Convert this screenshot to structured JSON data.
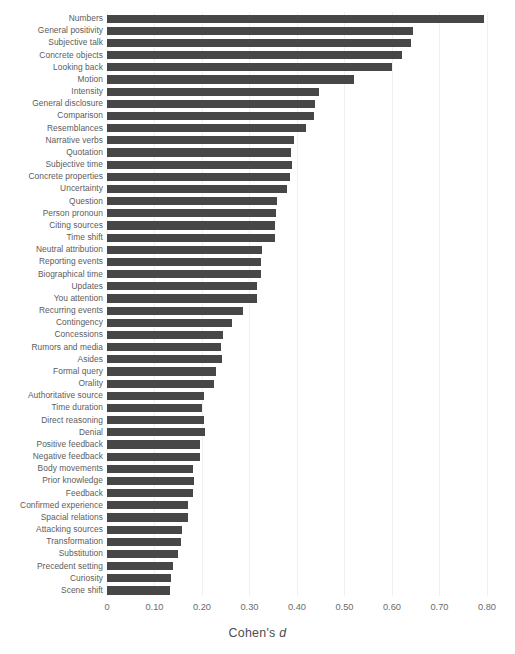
{
  "chart_data": {
    "type": "bar",
    "orientation": "horizontal",
    "title": "",
    "subtitle": "",
    "xlabel": "Cohen's d",
    "ylabel": "",
    "xlim": [
      0,
      0.838
    ],
    "xticks": [
      0,
      0.1,
      0.2,
      0.3,
      0.4,
      0.5,
      0.6,
      0.7,
      0.8
    ],
    "xtick_labels": [
      "0",
      "0.10",
      "0.20",
      "0.30",
      "0.40",
      "0.50",
      "0.60",
      "0.70",
      "0.80"
    ],
    "grid": true,
    "grid_axis": "x",
    "legend": null,
    "bar_color": "#474747",
    "label_color": "#5c5c5c",
    "tick_color": "#6b6b6b",
    "grid_color": "#f0f0f0",
    "categories": [
      "Numbers",
      "General positivity",
      "Subjective talk",
      "Concrete objects",
      "Looking back",
      "Motion",
      "Intensity",
      "General disclosure",
      "Comparison",
      "Resemblances",
      "Narrative verbs",
      "Quotation",
      "Subjective time",
      "Concrete properties",
      "Uncertainty",
      "Question",
      "Person pronoun",
      "Citing sources",
      "Time shift",
      "Neutral attribution",
      "Reporting events",
      "Biographical time",
      "Updates",
      "You attention",
      "Recurring events",
      "Contingency",
      "Concessions",
      "Rumors and media",
      "Asides",
      "Formal query",
      "Orality",
      "Authoritative source",
      "Time duration",
      "Direct reasoning",
      "Denial",
      "Positive feedback",
      "Negative feedback",
      "Body movements",
      "Prior knowledge",
      "Feedback",
      "Confirmed experience",
      "Spacial relations",
      "Attacking sources",
      "Transformation",
      "Substitution",
      "Precedent setting",
      "Curiosity",
      "Scene shift"
    ],
    "values": [
      0.794,
      0.644,
      0.64,
      0.621,
      0.601,
      0.52,
      0.446,
      0.438,
      0.435,
      0.419,
      0.394,
      0.388,
      0.389,
      0.386,
      0.379,
      0.358,
      0.355,
      0.354,
      0.354,
      0.326,
      0.324,
      0.324,
      0.316,
      0.316,
      0.286,
      0.264,
      0.245,
      0.24,
      0.242,
      0.229,
      0.225,
      0.204,
      0.201,
      0.204,
      0.207,
      0.195,
      0.196,
      0.182,
      0.183,
      0.181,
      0.171,
      0.17,
      0.158,
      0.155,
      0.15,
      0.138,
      0.135,
      0.132
    ]
  }
}
